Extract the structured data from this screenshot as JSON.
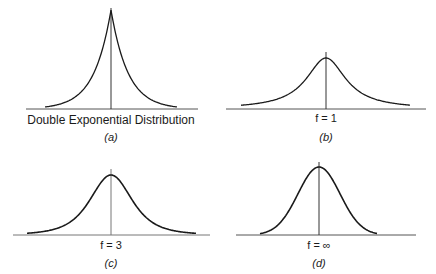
{
  "panels": [
    {
      "id": "a",
      "label": "Double Exponential Distribution",
      "caption": "(a)",
      "caption_letter": "a",
      "shape": "laplace"
    },
    {
      "id": "b",
      "label": "f = 1",
      "caption": "(b)",
      "caption_letter": "b",
      "shape": "cauchy"
    },
    {
      "id": "c",
      "label": "f = 3",
      "caption": "(c)",
      "caption_letter": "c",
      "shape": "student-t-3"
    },
    {
      "id": "d",
      "label": "f = ∞",
      "caption": "(d)",
      "caption_letter": "d",
      "shape": "normal"
    }
  ],
  "colors": {
    "curve": "#1a1a1a",
    "axis": "#555555",
    "background": "#ffffff"
  }
}
